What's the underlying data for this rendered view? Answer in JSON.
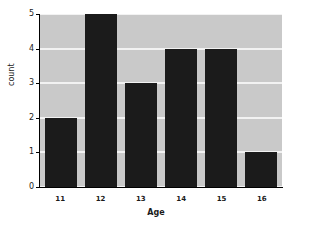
{
  "chart_data": {
    "type": "bar",
    "title": "",
    "subtitle": "",
    "xlabel": "Age",
    "ylabel": "count",
    "categories": [
      "11",
      "12",
      "13",
      "14",
      "15",
      "16"
    ],
    "values": [
      2,
      5,
      3,
      4,
      4,
      1
    ],
    "series": [
      {
        "name": "count",
        "values": [
          2,
          5,
          3,
          4,
          4,
          1
        ]
      }
    ],
    "ylim": [
      0,
      5
    ],
    "yticks": [
      "5",
      "4",
      "3",
      "2",
      "1",
      "0"
    ],
    "ytick_values": [
      5,
      4,
      3,
      2,
      1,
      0
    ],
    "xticks": [
      "11",
      "12",
      "13",
      "14",
      "15",
      "16"
    ],
    "grid": "horizontal",
    "legend": "none",
    "annotations": [],
    "colors": {
      "bar": "#1b1b1b",
      "plot_background": "#c9c9c9",
      "gridline": "#f2f2f2",
      "axis": "#000000",
      "text": "#1a1a1a",
      "figure_background": "#ffffff"
    }
  }
}
